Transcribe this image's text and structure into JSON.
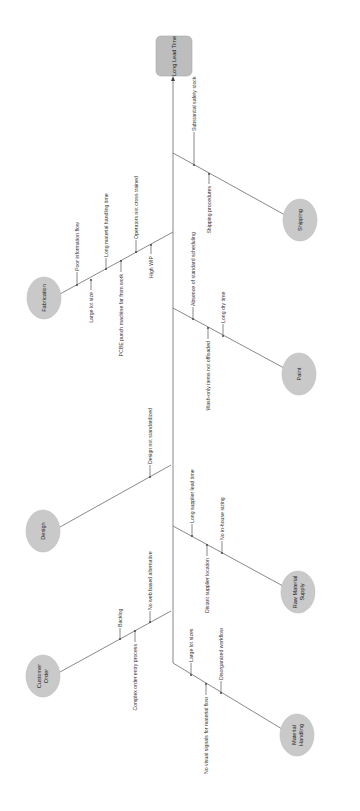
{
  "diagram": {
    "type": "fishbone",
    "orientation": "rotated-90",
    "colors": {
      "node_fill": "#c9c9c9",
      "head_fill": "#bdbdbd",
      "line": "#6b6b6b",
      "background": "#ffffff"
    },
    "effect": {
      "label": "Long Lead Time"
    },
    "causes": [
      {
        "label": "Shipping",
        "items": [
          "Substantial safety stock",
          "Shipping procedures"
        ]
      },
      {
        "label": "Fabrication",
        "items": [
          "Poor information flow",
          "Large lot size",
          "Long material handling time",
          "PCBE punch machine far from work",
          "Operators not cross trained",
          "High WIP"
        ]
      },
      {
        "label": "Paint",
        "items": [
          "Absence of standard scheduling",
          "Wash-only items not offloaded",
          "Long dry time"
        ]
      },
      {
        "label": "Design",
        "items": [
          "Design not standardized"
        ]
      },
      {
        "label": "Raw Material Supply",
        "line1": "Raw Material",
        "line2": "Supply",
        "items": [
          "Long supplier lead time",
          "Distant supplier location",
          "No in-house sizing"
        ]
      },
      {
        "label": "Customer Order",
        "line1": "Customer",
        "line2": "Order",
        "items": [
          "Backlog",
          "Complex order entry process",
          "No web based alternative"
        ]
      },
      {
        "label": "Material Handling",
        "line1": "Material",
        "line2": "Handling",
        "items": [
          "Large lot sizes",
          "No visual signals for material flow",
          "Disorganized workflow"
        ]
      }
    ]
  }
}
